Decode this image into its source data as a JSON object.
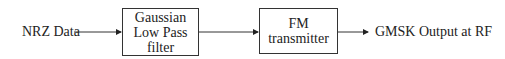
{
  "diagram": {
    "input_label": "NRZ Data",
    "blocks": [
      {
        "lines": [
          "Gaussian",
          "Low Pass",
          "filter"
        ]
      },
      {
        "lines": [
          "FM",
          "transmitter"
        ]
      }
    ],
    "output_label": "GMSK Output at RF"
  }
}
